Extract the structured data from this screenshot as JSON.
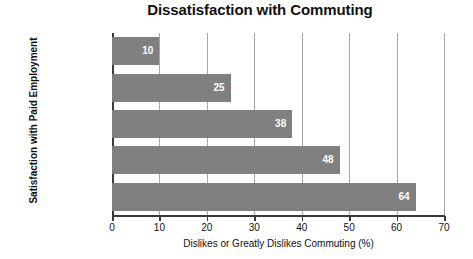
{
  "chart_data": {
    "type": "bar",
    "orientation": "horizontal",
    "title": "Dissatisfaction with Commuting",
    "xlabel": "Dislikes or Greatly Dislikes Commuting (%)",
    "ylabel": "Satisfaction with Paid Employment",
    "categories": [
      "Greatly Likes",
      "Likes",
      "Neutral",
      "Dislikes",
      "Greatly Likes"
    ],
    "values": [
      10,
      25,
      38,
      48,
      64
    ],
    "xlim": [
      0,
      70
    ],
    "xticks": [
      0,
      10,
      20,
      30,
      40,
      50,
      60,
      70
    ],
    "xticklabels": [
      "0",
      "10",
      "20",
      "30",
      "40",
      "50",
      "60",
      "70"
    ],
    "grid": "vertical",
    "legend": "none",
    "bar_color": "#808080",
    "gridline_color": "#a8a8a8",
    "axis_color": "#3a3a3a",
    "value_label_color": "#ffffff",
    "background_color": "#ffffff"
  }
}
